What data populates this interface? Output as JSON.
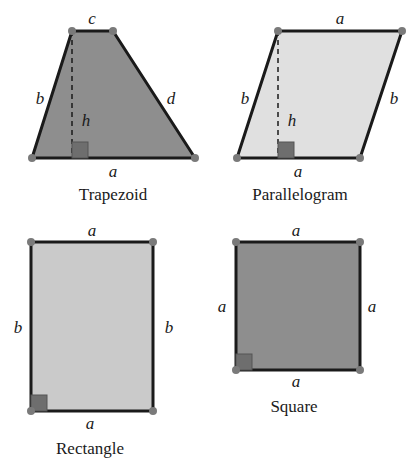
{
  "colors": {
    "edge": "#1a1a1a",
    "vertex": "#7a7a7a",
    "dark_fill": "#8e8e8e",
    "light_fill": "#d9d9d9",
    "mid_fill": "#c4c4c4",
    "right_angle": "#6e6e6e"
  },
  "shapes": [
    {
      "name": "Trapezoid",
      "title": "Trapezoid",
      "labels": {
        "top": "c",
        "left": "b",
        "right": "d",
        "height": "h",
        "bottom": "a"
      }
    },
    {
      "name": "Parallelogram",
      "title": "Parallelogram",
      "labels": {
        "top": "a",
        "left": "b",
        "right": "b",
        "height": "h",
        "bottom": "a"
      }
    },
    {
      "name": "Rectangle",
      "title": "Rectangle",
      "labels": {
        "top": "a",
        "left": "b",
        "right": "b",
        "bottom": "a"
      }
    },
    {
      "name": "Square",
      "title": "Square",
      "labels": {
        "top": "a",
        "left": "a",
        "right": "a",
        "bottom": "a"
      }
    }
  ]
}
